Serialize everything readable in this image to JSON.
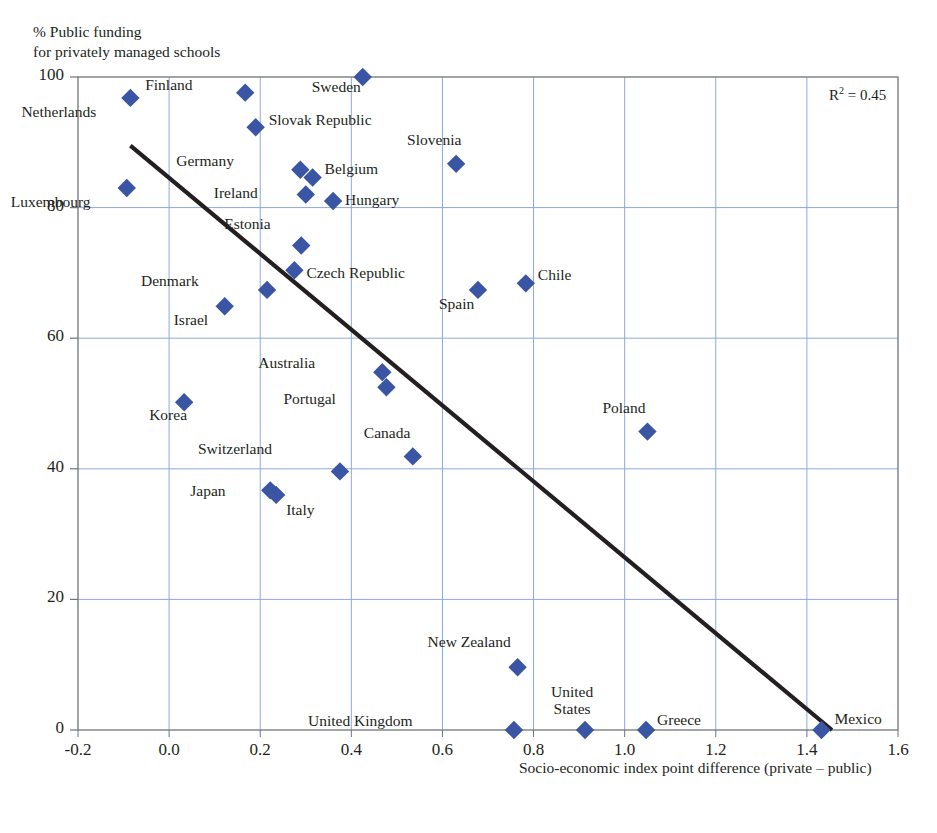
{
  "chart_data": {
    "type": "scatter",
    "title": "",
    "ylabel": "% Public funding\nfor privately managed schools",
    "xlabel": "Socio-economic index point difference (private – public)",
    "xlim": [
      -0.2,
      1.6
    ],
    "ylim": [
      0,
      100
    ],
    "xticks": [
      "-0.2",
      "0.0",
      "0.2",
      "0.4",
      "0.6",
      "0.8",
      "1.0",
      "1.2",
      "1.4",
      "1.6"
    ],
    "xtick_values": [
      -0.2,
      0.0,
      0.2,
      0.4,
      0.6,
      0.8,
      1.0,
      1.2,
      1.4,
      1.6
    ],
    "yticks": [
      "0",
      "20",
      "40",
      "60",
      "80",
      "100"
    ],
    "ytick_values": [
      0,
      20,
      40,
      60,
      80,
      100
    ],
    "grid": true,
    "legend": "none",
    "annotation": "R² = 0.45",
    "r_squared": 0.45,
    "marker": "diamond",
    "marker_color": "#3a55a4",
    "trendline": {
      "type": "linear",
      "x": [
        -0.085,
        1.455
      ],
      "y": [
        89.5,
        0.0
      ],
      "color": "#231f20"
    },
    "points": [
      {
        "label": "Netherlands",
        "x": -0.085,
        "y": 96.8,
        "label_dx": -46,
        "label_dy": 14
      },
      {
        "label": "Luxembourg",
        "x": -0.093,
        "y": 83.0,
        "label_dx": -48,
        "label_dy": 13
      },
      {
        "label": "Finland",
        "x": 0.167,
        "y": 97.6,
        "label_dx": -65,
        "label_dy": -8
      },
      {
        "label": "Slovak Republic",
        "x": 0.19,
        "y": 92.3,
        "label_dx": 13,
        "label_dy": -8
      },
      {
        "label": "Germany",
        "x": 0.288,
        "y": 85.8,
        "label_dx": -78,
        "label_dy": -9
      },
      {
        "label": "Belgium",
        "x": 0.315,
        "y": 84.6,
        "label_dx": 12,
        "label_dy": -9
      },
      {
        "label": "Ireland",
        "x": 0.3,
        "y": 82.0,
        "label_dx": -60,
        "label_dy": -2
      },
      {
        "label": "Hungary",
        "x": 0.36,
        "y": 81.0,
        "label_dx": 12,
        "label_dy": -2
      },
      {
        "label": "Sweden",
        "x": 0.425,
        "y": 100.0,
        "label_dx": -14,
        "label_dy": 9
      },
      {
        "label": "Slovenia",
        "x": 0.63,
        "y": 86.7,
        "label_dx": -7,
        "label_dy": -24
      },
      {
        "label": "Estonia",
        "x": 0.29,
        "y": 74.2,
        "label_dx": -42,
        "label_dy": -22
      },
      {
        "label": "Czech Republic",
        "x": 0.275,
        "y": 70.4,
        "label_dx": 12,
        "label_dy": 2
      },
      {
        "label": "Denmark",
        "x": 0.215,
        "y": 67.4,
        "label_dx": -80,
        "label_dy": -9
      },
      {
        "label": "Israel",
        "x": 0.122,
        "y": 64.9,
        "label_dx": -29,
        "label_dy": 13
      },
      {
        "label": "Spain",
        "x": 0.678,
        "y": 67.4,
        "label_dx": -16,
        "label_dy": 14
      },
      {
        "label": "Chile",
        "x": 0.783,
        "y": 68.4,
        "label_dx": 12,
        "label_dy": -9
      },
      {
        "label": "Australia",
        "x": 0.468,
        "y": 54.8,
        "label_dx": -79,
        "label_dy": -10
      },
      {
        "label": "Portugal",
        "x": 0.477,
        "y": 52.5,
        "label_dx": -62,
        "label_dy": 11
      },
      {
        "label": "Korea",
        "x": 0.033,
        "y": 50.2,
        "label_dx": -9,
        "label_dy": 12
      },
      {
        "label": "Poland",
        "x": 1.05,
        "y": 45.7,
        "label_dx": -14,
        "label_dy": -24
      },
      {
        "label": "Canada",
        "x": 0.535,
        "y": 41.9,
        "label_dx": -15,
        "label_dy": -24
      },
      {
        "label": "Switzerland",
        "x": 0.375,
        "y": 39.6,
        "label_dx": -80,
        "label_dy": -23
      },
      {
        "label": "Japan",
        "x": 0.222,
        "y": 36.7,
        "label_dx": -57,
        "label_dy": 0
      },
      {
        "label": "Italy",
        "x": 0.235,
        "y": 36.0,
        "label_dx": 10,
        "label_dy": 15
      },
      {
        "label": "New Zealand",
        "x": 0.765,
        "y": 9.6,
        "label_dx": -19,
        "label_dy": -26
      },
      {
        "label": "United Kingdom",
        "x": 0.757,
        "y": 0.0,
        "label_dx": -113,
        "label_dy": -10
      },
      {
        "label": "United\nStates",
        "x": 0.913,
        "y": 0.0,
        "label_dx": -25,
        "label_dy": -30
      },
      {
        "label": "Greece",
        "x": 1.047,
        "y": 0.0,
        "label_dx": 11,
        "label_dy": -11
      },
      {
        "label": "Mexico",
        "x": 1.432,
        "y": 0.0,
        "label_dx": 13,
        "label_dy": -12
      }
    ]
  },
  "plot": {
    "grid_color": "#8fa8dc",
    "frame_color": "#6f7579",
    "background": "#ffffff"
  }
}
